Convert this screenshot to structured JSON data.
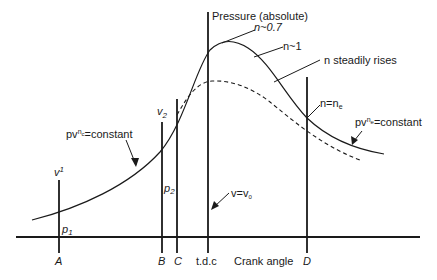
{
  "diagram": {
    "axes": {
      "y_label": "Pressure (absolute)",
      "x_label": "Crank angle"
    },
    "x_markers": [
      {
        "id": "A",
        "label": "A"
      },
      {
        "id": "B",
        "label": "B"
      },
      {
        "id": "C",
        "label": "C"
      },
      {
        "id": "tdc",
        "label": "t.d.c"
      },
      {
        "id": "D",
        "label": "D"
      }
    ],
    "annotations": {
      "v1": "v",
      "v1_sub": "1",
      "p1": "p",
      "p1_sub": "1",
      "v2": "v",
      "v2_sub": "2",
      "p2": "p",
      "p2_sub": "2",
      "compression": "pv^c=constant",
      "compression_prefix": "pv",
      "compression_sup": "n",
      "compression_sub": "c",
      "compression_suffix": "=constant",
      "expansion_prefix": "pv",
      "expansion_sup": "n",
      "expansion_sub": "e",
      "expansion_suffix": "=constant",
      "n07": "n~0.7",
      "n1": "n~1",
      "n_rises": "n steadily rises",
      "n_ne_prefix": "n=n",
      "n_ne_sub": "e",
      "v_v0_prefix": "v=v",
      "v_v0_sub": "0"
    },
    "curves": [
      {
        "name": "firing-pressure",
        "style": "solid"
      },
      {
        "name": "motoring-pressure",
        "style": "dashed"
      }
    ]
  }
}
